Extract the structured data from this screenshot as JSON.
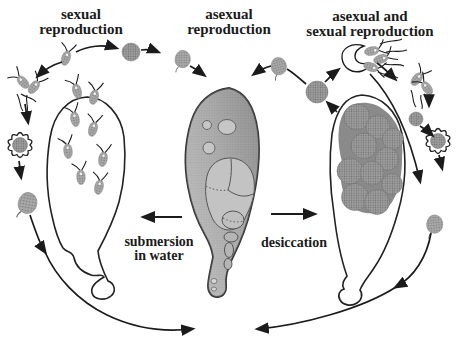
{
  "labels": {
    "left_top": {
      "line1": "sexual",
      "line2": "reproduction"
    },
    "center_top": {
      "line1": "asexual",
      "line2": "reproduction"
    },
    "right_top": {
      "line1": "asexual and",
      "line2": "sexual reproduction"
    },
    "left_transition": {
      "line1": "submersion",
      "line2": "in water"
    },
    "right_transition": {
      "line1": "desiccation"
    }
  },
  "colors": {
    "ink": "#1b1b1b",
    "bg": "#ffffff",
    "cell-gray": "#a9a9a9",
    "cell-gray-dark": "#8a8a8a",
    "body-light": "#cacaca",
    "body-dark": "#8d8d8d",
    "compartment": "#c3c3c3"
  },
  "icons": [
    "flagellate-cell-icon",
    "gamete-pair-icon",
    "spiky-cyst-icon",
    "zygote-cell-icon",
    "amoeba-cell-icon",
    "plasmodium-body-icon",
    "cyst-cluster-icon",
    "excystment-shell-icon",
    "arrow-icon"
  ]
}
